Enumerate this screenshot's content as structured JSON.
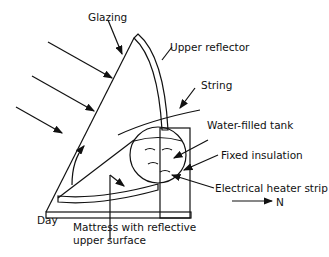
{
  "diagram": {
    "labels": {
      "glazing": "Glazing",
      "upper_reflector": "Upper reflector",
      "string": "String",
      "water_tank": "Water-filled tank",
      "fixed_insulation": "Fixed insulation",
      "heater_strip": "Electrical heater strip",
      "north": "N",
      "day": "Day",
      "mattress_line1": "Mattress with reflective",
      "mattress_line2": "upper surface"
    },
    "colors": {
      "line": "#111111",
      "background": "#ffffff"
    }
  }
}
